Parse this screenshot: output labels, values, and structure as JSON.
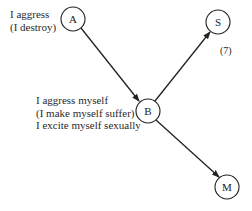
{
  "diagram": {
    "nodes": [
      {
        "id": "A",
        "label": "A",
        "cx": 73,
        "cy": 19
      },
      {
        "id": "B",
        "label": "B",
        "cx": 148,
        "cy": 111
      },
      {
        "id": "S",
        "label": "S",
        "cx": 218,
        "cy": 22
      },
      {
        "id": "M",
        "label": "M",
        "cx": 227,
        "cy": 187
      }
    ],
    "edges": [
      {
        "from": "A",
        "to": "B"
      },
      {
        "from": "B",
        "to": "S"
      },
      {
        "from": "B",
        "to": "M"
      }
    ],
    "labels": {
      "a_line1": "I aggress",
      "a_line2": "(I destroy)",
      "b_line1": "I aggress myself",
      "b_line2": "(I make myself suffer)",
      "b_line3": "I excite myself sexually",
      "figure_number": "(7)"
    },
    "colors": {
      "stroke": "#222222",
      "background": "#ffffff"
    }
  }
}
